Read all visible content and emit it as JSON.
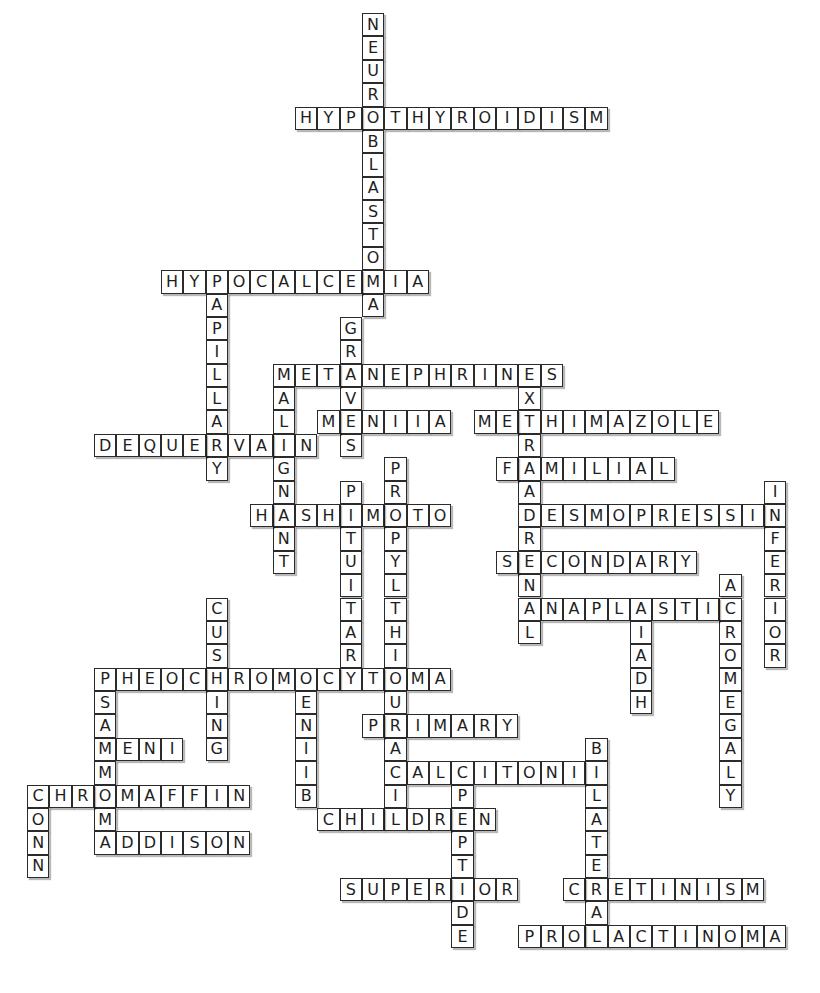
{
  "puzzle": {
    "type": "crossword-solution",
    "grid": {
      "origin_x": 27,
      "origin_y": 13,
      "cell_w": 22.33,
      "cell_h": 23.38
    },
    "colors": {
      "border": "#2b2b2b",
      "text": "#1e1e1e",
      "background": "#ffffff"
    },
    "words": [
      {
        "word": "NEUROBLASTOMA",
        "dir": "down",
        "col": 15,
        "row": 0
      },
      {
        "word": "HYPOTHYROIDISM",
        "dir": "across",
        "col": 12,
        "row": 4
      },
      {
        "word": "HYPOCALCEMIA",
        "dir": "across",
        "col": 6,
        "row": 11
      },
      {
        "word": "PAPILLARY",
        "dir": "down",
        "col": 8,
        "row": 11
      },
      {
        "word": "GRAVES",
        "dir": "down",
        "col": 14,
        "row": 13
      },
      {
        "word": "METANEPHRINES",
        "dir": "across",
        "col": 11,
        "row": 15
      },
      {
        "word": "MALIGNANT",
        "dir": "down",
        "col": 11,
        "row": 15
      },
      {
        "word": "EXTRAADRENAL",
        "dir": "down",
        "col": 22,
        "row": 15
      },
      {
        "word": "MENIIA",
        "dir": "across",
        "col": 13,
        "row": 17
      },
      {
        "word": "METHIMAZOLE",
        "dir": "across",
        "col": 20,
        "row": 17
      },
      {
        "word": "DEQUERVAIN",
        "dir": "across",
        "col": 3,
        "row": 18
      },
      {
        "word": "FAMILIAL",
        "dir": "across",
        "col": 21,
        "row": 19
      },
      {
        "word": "PROPYLTHIOURACIL",
        "dir": "down",
        "col": 16,
        "row": 19
      },
      {
        "word": "PITUITARY",
        "dir": "down",
        "col": 14,
        "row": 20
      },
      {
        "word": "INFERIOR",
        "dir": "down",
        "col": 33,
        "row": 20
      },
      {
        "word": "HASHIMOTO",
        "dir": "across",
        "col": 10,
        "row": 21
      },
      {
        "word": "DESMOPRESSIN",
        "dir": "across",
        "col": 22,
        "row": 21
      },
      {
        "word": "SECONDARY",
        "dir": "across",
        "col": 21,
        "row": 23
      },
      {
        "word": "ACROMEGALY",
        "dir": "down",
        "col": 31,
        "row": 24
      },
      {
        "word": "ANAPLASTIC",
        "dir": "across",
        "col": 22,
        "row": 25
      },
      {
        "word": "SIADH",
        "dir": "down",
        "col": 27,
        "row": 25
      },
      {
        "word": "CUSHING",
        "dir": "down",
        "col": 8,
        "row": 25
      },
      {
        "word": "PHEOCHROMOCYTOMA",
        "dir": "across",
        "col": 3,
        "row": 28
      },
      {
        "word": "PSAMMOMA",
        "dir": "down",
        "col": 3,
        "row": 28
      },
      {
        "word": "MENIIB",
        "dir": "down",
        "col": 12,
        "row": 28
      },
      {
        "word": "PRIMARY",
        "dir": "across",
        "col": 15,
        "row": 30
      },
      {
        "word": "MENI",
        "dir": "across",
        "col": 3,
        "row": 31
      },
      {
        "word": "BILATERAL",
        "dir": "down",
        "col": 25,
        "row": 31
      },
      {
        "word": "CALCITONIN",
        "dir": "across",
        "col": 16,
        "row": 32
      },
      {
        "word": "CPEPTIDE",
        "dir": "down",
        "col": 19,
        "row": 32
      },
      {
        "word": "CHROMAFFIN",
        "dir": "across",
        "col": 0,
        "row": 33
      },
      {
        "word": "CONN",
        "dir": "down",
        "col": 0,
        "row": 33
      },
      {
        "word": "CHILDREN",
        "dir": "across",
        "col": 13,
        "row": 34
      },
      {
        "word": "ADDISON",
        "dir": "across",
        "col": 3,
        "row": 35
      },
      {
        "word": "SUPERIOR",
        "dir": "across",
        "col": 14,
        "row": 37
      },
      {
        "word": "CRETINISM",
        "dir": "across",
        "col": 24,
        "row": 37
      },
      {
        "word": "PROLACTINOMA",
        "dir": "across",
        "col": 22,
        "row": 39
      }
    ]
  }
}
